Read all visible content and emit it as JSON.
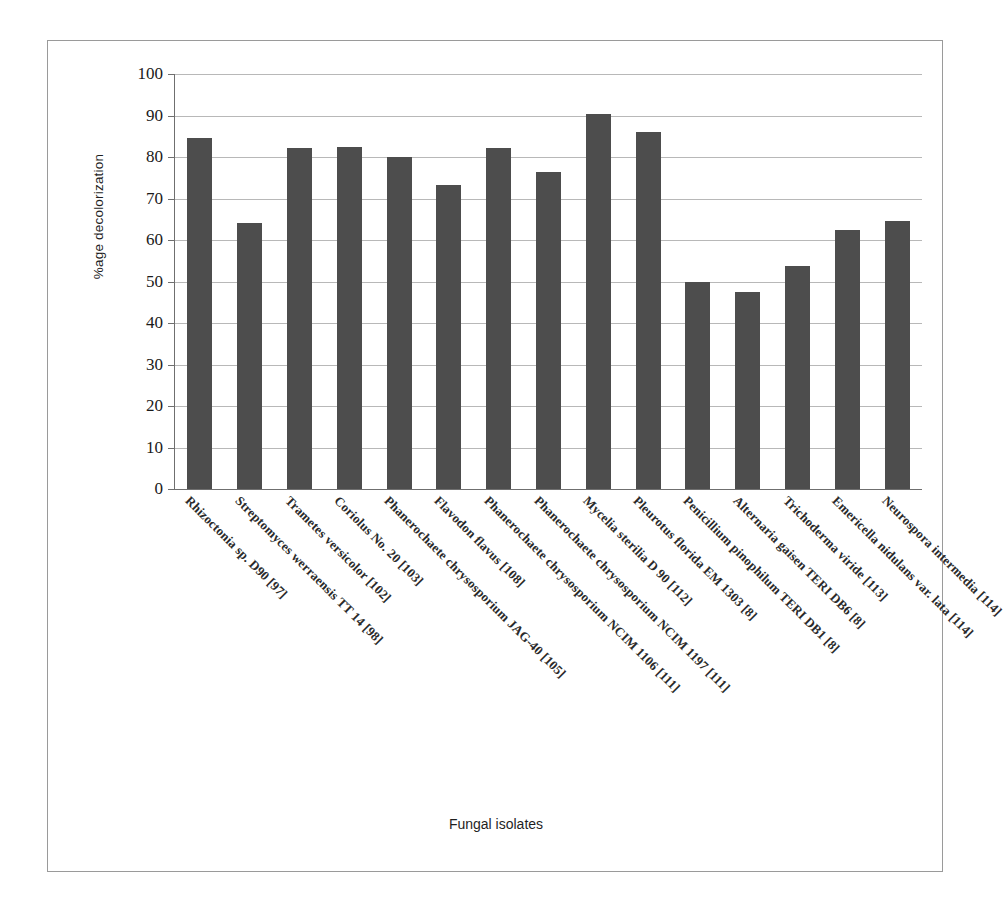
{
  "chart_data": {
    "type": "bar",
    "title": "",
    "xlabel": "Fungal isolates",
    "ylabel": "%age decolorization",
    "ylim": [
      0,
      100
    ],
    "ytick_step": 10,
    "yticks": [
      100,
      90,
      80,
      70,
      60,
      50,
      40,
      30,
      20,
      10,
      0
    ],
    "grid": true,
    "legend": "none",
    "bar_color": "#4d4d4d",
    "categories": [
      "Rhizoctonia sp. D90 [97]",
      "Streptomyces werraensis TT 14 [98]",
      "Trametes versicolor [102]",
      "Coriolus No. 20 [103]",
      "Phanerochaete chrysosporium JAG-40 [105]",
      "Flavodon flavus [108]",
      "Phanerochaete chrysosporium NCIM 1106 [111]",
      "Phanerochaete chrysosporium NCIM 1197 [111]",
      "Mycelia sterilia D 90 [112]",
      "Pleurotus florida EM 1303 [8]",
      "Penicillium pinophilum TERI DB1 [8]",
      "Alternaria gaisen TERI DB6 [8]",
      "Trichoderma viride [113]",
      "Emericella nidulans var. lata [114]",
      "Neurospora intermedia [114]"
    ],
    "values": [
      84.5,
      64.2,
      82.1,
      82.4,
      80.0,
      73.2,
      82.1,
      76.3,
      90.3,
      86.0,
      50.0,
      47.5,
      53.8,
      62.3,
      64.5
    ]
  },
  "figure": {
    "y_axis_title": "%age decolorization",
    "x_axis_title": "Fungal isolates"
  }
}
